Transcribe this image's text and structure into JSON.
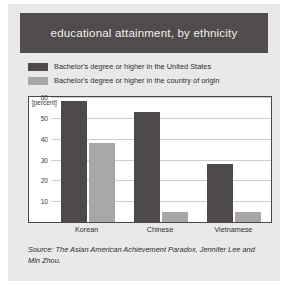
{
  "figure": {
    "title": "educational attainment, by ethnicity",
    "source": "Source: The Asian American Achievement Paradox, Jennifer Lee and Min Zhou.",
    "colors": {
      "banner_bg": "#4f4c4b",
      "banner_text": "#f2f0ee",
      "series_us": "#4d4a49",
      "series_origin": "#a9a7a5",
      "page_bg": "#e9e9e9",
      "plot_bg": "#ffffff",
      "gridline": "#cfcdcc"
    }
  },
  "legend": {
    "items": [
      {
        "label": "Bachelor's degree or higher in the United States",
        "color": "#4d4a49",
        "swatch_name": "legend-swatch-united-states"
      },
      {
        "label": "Bachelor's degree or higher in the country of origin",
        "color": "#a9a7a5",
        "swatch_name": "legend-swatch-country-of-origin"
      }
    ]
  },
  "chart_data": {
    "type": "bar",
    "title": "educational attainment, by ethnicity",
    "xlabel": "",
    "ylabel": "[percent]",
    "unit_note": "[percent]",
    "categories": [
      "Korean",
      "Chinese",
      "Vietnamese"
    ],
    "series": [
      {
        "name": "Bachelor's degree or higher in the United States",
        "color": "#4d4a49",
        "values": [
          58,
          53,
          28
        ]
      },
      {
        "name": "Bachelor's degree or higher in the country of origin",
        "color": "#a9a7a5",
        "values": [
          38,
          5,
          5
        ]
      }
    ],
    "ylim": [
      0,
      60
    ],
    "yticks": [
      10,
      20,
      30,
      40,
      50,
      60
    ],
    "ytick_labels": [
      "10",
      "20",
      "30",
      "40",
      "50",
      "60"
    ],
    "grid": true,
    "grid_axis": "y",
    "legend_position": "above-plot"
  }
}
